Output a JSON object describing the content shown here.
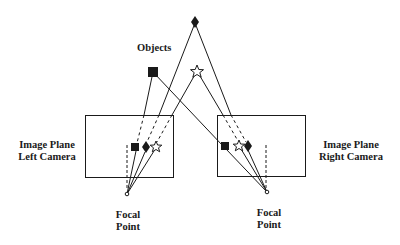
{
  "labels": {
    "objects": "Objects",
    "left_plane_line1": "Image Plane",
    "left_plane_line2": "Left Camera",
    "right_plane_line1": "Image Plane",
    "right_plane_line2": "Right Camera",
    "left_focal_line1": "Focal",
    "left_focal_line2": "Point",
    "right_focal_line1": "Focal",
    "right_focal_line2": "Point"
  },
  "objects": [
    {
      "name": "square",
      "shape": "filled-square"
    },
    {
      "name": "diamond",
      "shape": "filled-diamond"
    },
    {
      "name": "star",
      "shape": "outline-star"
    }
  ],
  "colors": {
    "stroke": "#1a1a1a",
    "background": "#ffffff"
  }
}
